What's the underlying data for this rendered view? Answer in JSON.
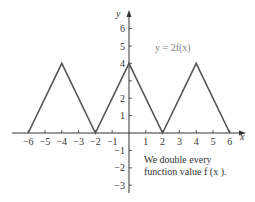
{
  "chart_data": {
    "type": "line",
    "title": "",
    "xlabel": "x",
    "ylabel": "y",
    "xlim": [
      -7,
      7
    ],
    "ylim": [
      -3.5,
      7
    ],
    "grid": false,
    "x_ticks": [
      -6,
      -5,
      -4,
      -3,
      -2,
      -1,
      1,
      2,
      3,
      4,
      5,
      6
    ],
    "x_tick_labels": [
      "−6",
      "−5",
      "−4",
      "−3",
      "−2",
      "−1",
      "1",
      "2",
      "3",
      "4",
      "5",
      "6"
    ],
    "y_ticks": [
      -3,
      -2,
      -1,
      1,
      2,
      3,
      4,
      5,
      6
    ],
    "y_tick_labels": [
      "−3",
      "−2",
      "−1",
      "1",
      "2",
      "",
      "4",
      "5",
      "6"
    ],
    "series": [
      {
        "name": "y = 2f(x)",
        "x": [
          -6,
          -4,
          -2,
          0,
          2,
          4,
          6
        ],
        "y": [
          0,
          4,
          0,
          4,
          0,
          4,
          0
        ]
      }
    ],
    "annotations": [
      {
        "text": "y = 2f(x)",
        "position": "upper-right of curve"
      },
      {
        "text_lines": [
          "We double every",
          "function value f(x)."
        ],
        "position": "lower-right"
      }
    ]
  },
  "labels": {
    "function": "y = 2f(x)",
    "note_line1": "We double every",
    "note_line2": "function value f (x )."
  },
  "colors": {
    "curve": "#555555",
    "axis": "#333333",
    "label_gray": "#7a7a7a"
  }
}
